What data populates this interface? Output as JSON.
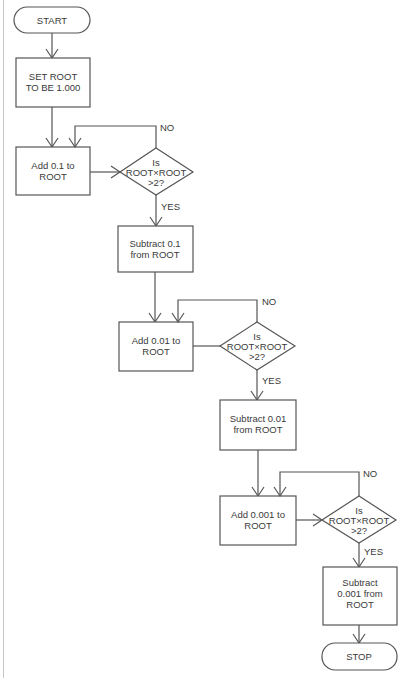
{
  "flowchart": {
    "start": {
      "label": "START"
    },
    "init": {
      "line1": "SET ROOT",
      "line2": "TO BE 1.000"
    },
    "stage1": {
      "add": {
        "line1": "Add 0.1 to",
        "line2": "ROOT"
      },
      "decision": {
        "line1": "Is",
        "line2": "ROOT×ROOT",
        "line3": ">2?"
      },
      "no_label": "NO",
      "yes_label": "YES",
      "subtract": {
        "line1": "Subtract 0.1",
        "line2": "from ROOT"
      }
    },
    "stage2": {
      "add": {
        "line1": "Add 0.01 to",
        "line2": "ROOT"
      },
      "decision": {
        "line1": "Is",
        "line2": "ROOT×ROOT",
        "line3": ">2?"
      },
      "no_label": "NO",
      "yes_label": "YES",
      "subtract": {
        "line1": "Subtract 0.01",
        "line2": "from ROOT"
      }
    },
    "stage3": {
      "add": {
        "line1": "Add 0.001 to",
        "line2": "ROOT"
      },
      "decision": {
        "line1": "Is",
        "line2": "ROOT×ROOT",
        "line3": ">2?"
      },
      "no_label": "NO",
      "yes_label": "YES",
      "subtract": {
        "line1": "Subtract",
        "line2": "0.001 from",
        "line3": "ROOT"
      }
    },
    "stop": {
      "label": "STOP"
    }
  }
}
